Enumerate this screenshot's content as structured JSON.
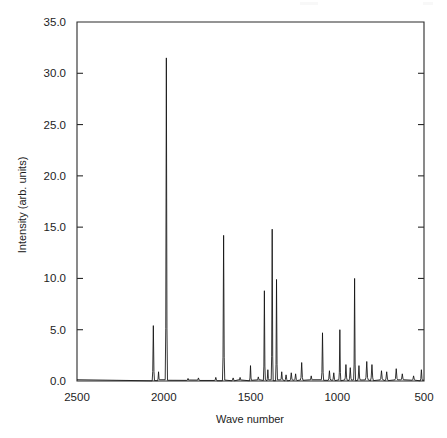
{
  "chart_data": {
    "type": "line",
    "title": "",
    "xlabel": "Wave number",
    "ylabel": "Intensity (arb. units)",
    "xlim": [
      2500,
      500
    ],
    "ylim": [
      0.0,
      35.0
    ],
    "x_reversed": true,
    "grid": false,
    "legend": null,
    "xticks": [
      2500,
      2000,
      1500,
      1000,
      500
    ],
    "xtick_labels": [
      "2500",
      "2000",
      "1500",
      "1000",
      "500"
    ],
    "yticks": [
      0.0,
      5.0,
      10.0,
      15.0,
      20.0,
      25.0,
      30.0,
      35.0
    ],
    "ytick_labels": [
      "0.0",
      "5.0",
      "10.0",
      "15.0",
      "20.0",
      "25.0",
      "30.0",
      "35.0"
    ],
    "series": [
      {
        "name": "spectrum",
        "color": "#111111",
        "peaks": [
          {
            "x": 2060,
            "y": 5.4,
            "w": 7
          },
          {
            "x": 2030,
            "y": 0.9,
            "w": 6
          },
          {
            "x": 1985,
            "y": 31.5,
            "w": 7
          },
          {
            "x": 1860,
            "y": 0.25,
            "w": 8
          },
          {
            "x": 1800,
            "y": 0.3,
            "w": 8
          },
          {
            "x": 1700,
            "y": 0.35,
            "w": 8
          },
          {
            "x": 1655,
            "y": 14.2,
            "w": 7
          },
          {
            "x": 1600,
            "y": 0.3,
            "w": 8
          },
          {
            "x": 1560,
            "y": 0.35,
            "w": 8
          },
          {
            "x": 1500,
            "y": 1.5,
            "w": 6
          },
          {
            "x": 1455,
            "y": 0.4,
            "w": 8
          },
          {
            "x": 1420,
            "y": 8.8,
            "w": 6
          },
          {
            "x": 1400,
            "y": 1.1,
            "w": 6
          },
          {
            "x": 1375,
            "y": 14.8,
            "w": 6
          },
          {
            "x": 1350,
            "y": 9.9,
            "w": 6
          },
          {
            "x": 1320,
            "y": 0.9,
            "w": 7
          },
          {
            "x": 1295,
            "y": 0.6,
            "w": 8
          },
          {
            "x": 1265,
            "y": 0.8,
            "w": 8
          },
          {
            "x": 1240,
            "y": 0.7,
            "w": 8
          },
          {
            "x": 1205,
            "y": 1.8,
            "w": 8
          },
          {
            "x": 1150,
            "y": 0.5,
            "w": 8
          },
          {
            "x": 1085,
            "y": 4.7,
            "w": 7
          },
          {
            "x": 1045,
            "y": 1.0,
            "w": 8
          },
          {
            "x": 1020,
            "y": 0.8,
            "w": 8
          },
          {
            "x": 985,
            "y": 5.0,
            "w": 6
          },
          {
            "x": 950,
            "y": 1.6,
            "w": 8
          },
          {
            "x": 925,
            "y": 1.3,
            "w": 8
          },
          {
            "x": 900,
            "y": 10.0,
            "w": 6
          },
          {
            "x": 875,
            "y": 1.5,
            "w": 8
          },
          {
            "x": 830,
            "y": 1.9,
            "w": 9
          },
          {
            "x": 800,
            "y": 1.6,
            "w": 9
          },
          {
            "x": 745,
            "y": 1.0,
            "w": 9
          },
          {
            "x": 715,
            "y": 0.9,
            "w": 9
          },
          {
            "x": 660,
            "y": 1.2,
            "w": 9
          },
          {
            "x": 625,
            "y": 0.7,
            "w": 9
          },
          {
            "x": 560,
            "y": 0.5,
            "w": 9
          },
          {
            "x": 515,
            "y": 1.1,
            "w": 7
          }
        ],
        "baseline": 0.05
      }
    ]
  },
  "axes": {
    "x_title": "Wave number",
    "y_title": "Intensity (arb. units)"
  }
}
